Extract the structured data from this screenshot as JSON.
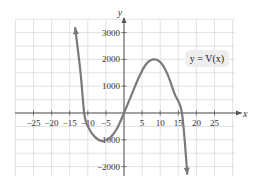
{
  "chart_data": {
    "type": "line",
    "title": "",
    "xlabel": "x",
    "ylabel": "y",
    "legend": "y = V(x)",
    "xlim": [
      -30,
      30
    ],
    "ylim": [
      -2500,
      3500
    ],
    "grid": true,
    "x_ticks": [
      -25,
      -20,
      -15,
      -10,
      -5,
      5,
      10,
      15,
      20,
      25
    ],
    "y_ticks": [
      3000,
      2000,
      1000,
      -1000,
      -2000
    ],
    "x_tick_labels": [
      "−25",
      "−20",
      "−15",
      "−10",
      "−5",
      "5",
      "10",
      "15",
      "20",
      "25"
    ],
    "y_tick_labels": [
      "3000",
      "2000",
      "1000",
      "−1000",
      "−2000"
    ],
    "series": [
      {
        "name": "y = V(x)",
        "description": "cubic curve with arrows at both ends; roots near x=-11, 0, 16; local min near (-5,-1000); local max near (8,2000)",
        "x": [
          -13.5,
          -12,
          -11,
          -10,
          -8,
          -6,
          -5,
          -4,
          -2,
          0,
          2,
          4,
          6,
          8,
          10,
          12,
          14,
          16,
          17.5
        ],
        "y": [
          3200,
          1500,
          0,
          -500,
          -900,
          -1050,
          -1000,
          -950,
          -600,
          0,
          650,
          1300,
          1800,
          2000,
          1900,
          1450,
          700,
          0,
          -2300
        ],
        "color": "#7a7a7a"
      }
    ]
  },
  "labels": {
    "x_axis": "x",
    "y_axis": "y",
    "function": "y = V(x)"
  },
  "colors": {
    "grid": "#d9d9d9",
    "axis": "#555555",
    "curve": "#7a7a7a",
    "label_bg": "#eeeeee"
  }
}
